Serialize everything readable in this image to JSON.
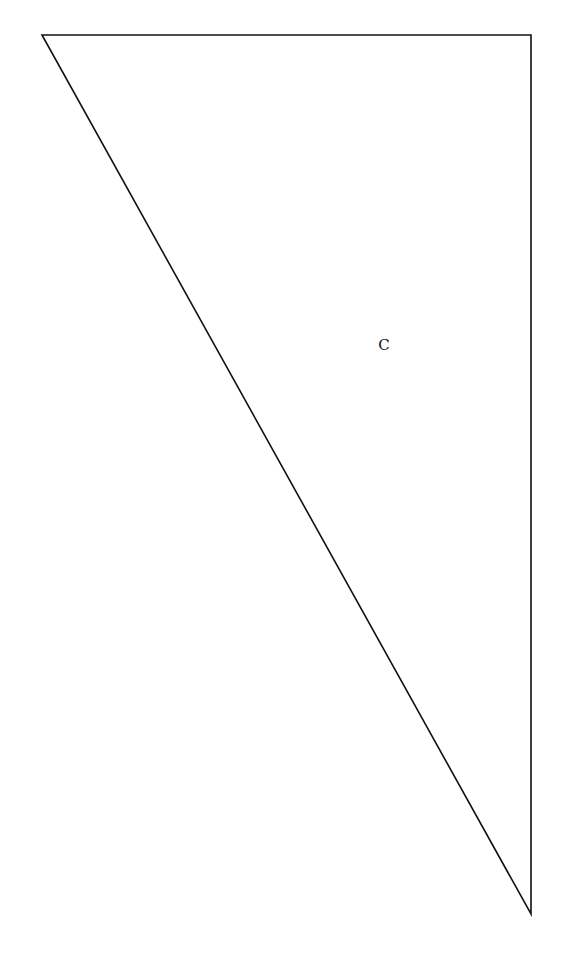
{
  "diagram": {
    "shape": "right-triangle",
    "vertices": [
      [
        42,
        35
      ],
      [
        531,
        35
      ],
      [
        531,
        914
      ]
    ],
    "stroke_color": "#111111",
    "stroke_width": 1.6,
    "label": {
      "text": "C",
      "x": 384,
      "y": 345
    }
  }
}
